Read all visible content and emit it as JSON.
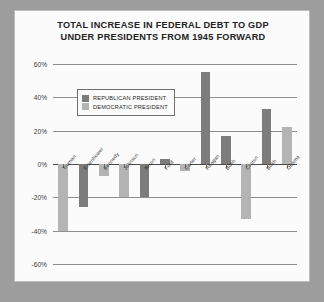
{
  "chart_data": {
    "type": "bar",
    "title": "TOTAL INCREASE IN FEDERAL DEBT TO GDP UNDER PRESIDENTS FROM 1945 FORWARD",
    "title_line1": "TOTAL INCREASE IN FEDERAL DEBT TO GDP",
    "title_line2": "UNDER PRESIDENTS FROM 1945 FORWARD",
    "xlabel": "",
    "ylabel": "",
    "ylim": [
      -60,
      60
    ],
    "ytick_values": [
      60,
      40,
      20,
      0,
      -20,
      -40,
      -60
    ],
    "ytick_labels": [
      "60%",
      "40%",
      "20%",
      "0%",
      "-20%",
      "-40%",
      "-60%"
    ],
    "grid": true,
    "legend_position": "upper-left-inside",
    "categories": [
      "TRUMAN",
      "EISENHOWER",
      "KENNEDY",
      "JOHNSON",
      "NIXON",
      "FORD",
      "CARTER",
      "REAGAN",
      "BUSH",
      "CLINTON",
      "BUSH",
      "OBAMA"
    ],
    "values": [
      -40,
      -26,
      -7,
      -20,
      -20,
      3,
      -4,
      55,
      17,
      -33,
      33,
      22
    ],
    "parties": [
      "democratic",
      "republican",
      "democratic",
      "democratic",
      "republican",
      "republican",
      "democratic",
      "republican",
      "republican",
      "democratic",
      "republican",
      "democratic"
    ],
    "series": [
      {
        "name": "REPUBLICAN PRESIDENT",
        "color": "#7c7c7c",
        "points": [
          {
            "category": "EISENHOWER",
            "value": -26
          },
          {
            "category": "NIXON",
            "value": -20
          },
          {
            "category": "FORD",
            "value": 3
          },
          {
            "category": "REAGAN",
            "value": 55
          },
          {
            "category": "BUSH",
            "value": 17
          },
          {
            "category": "BUSH",
            "value": 33
          }
        ]
      },
      {
        "name": "DEMOCRATIC PRESIDENT",
        "color": "#b4b4b4",
        "points": [
          {
            "category": "TRUMAN",
            "value": -40
          },
          {
            "category": "KENNEDY",
            "value": -7
          },
          {
            "category": "JOHNSON",
            "value": -20
          },
          {
            "category": "CARTER",
            "value": -4
          },
          {
            "category": "CLINTON",
            "value": -33
          },
          {
            "category": "OBAMA",
            "value": 22
          }
        ]
      }
    ]
  },
  "legend": {
    "items": [
      {
        "label": "REPUBLICAN PRESIDENT",
        "color": "#7c7c7c"
      },
      {
        "label": "DEMOCRATIC PRESIDENT",
        "color": "#b4b4b4"
      }
    ]
  },
  "colors": {
    "republican": "#7c7c7c",
    "democratic": "#b4b4b4",
    "frame": "#9d9d9d",
    "panel": "#fbfbfb",
    "gridline": "#8e8e8e",
    "axis": "#4a4a4a",
    "text": "#232323"
  }
}
